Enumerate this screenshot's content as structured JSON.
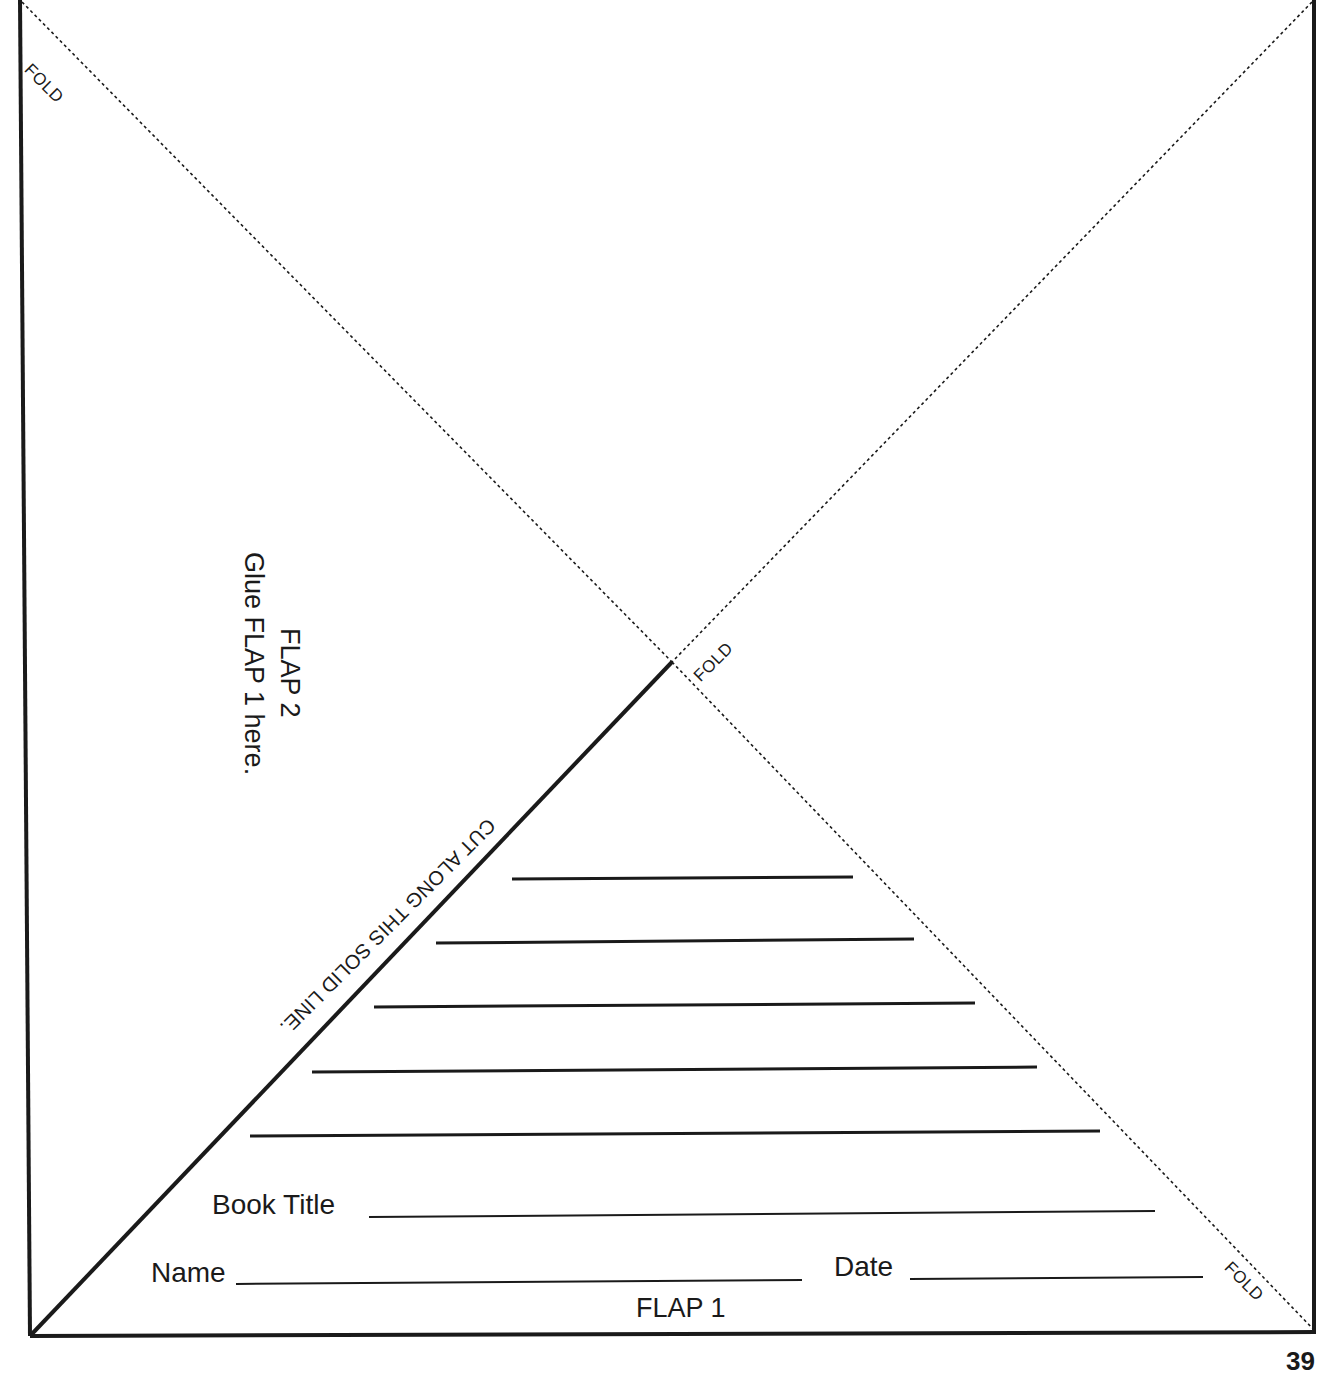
{
  "sheet": {
    "fold_labels": [
      "FOLD",
      "FOLD",
      "FOLD"
    ],
    "flap2": {
      "title": "FLAP 2",
      "instruction": "Glue FLAP 1 here."
    },
    "cut_label": "CUT ALONG THIS SOLID LINE.",
    "writing_lines_count": 5,
    "book_title_label": "Book Title",
    "name_label": "Name",
    "date_label": "Date",
    "flap1_label": "FLAP 1",
    "page_number": "39"
  },
  "colors": {
    "ink": "#1a1a1a",
    "paper": "#ffffff"
  }
}
